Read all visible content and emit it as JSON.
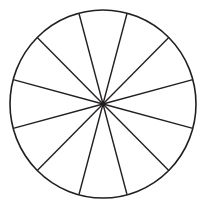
{
  "figure": {
    "name": "fraction-circle",
    "title": "Circle divided into twelve equal sectors",
    "shape": "circle",
    "background_color": "#ffffff",
    "stroke_color": "#231f20",
    "fill_color": "#ffffff",
    "outline_stroke_width": 1.6,
    "divider_stroke_width": 1.4
  },
  "geometry": {
    "center_x": 103,
    "center_y": 104,
    "radius_x": 93,
    "radius_y": 94,
    "bounds": {
      "left": 10,
      "top": 10,
      "right": 196,
      "bottom": 198
    }
  },
  "sectors": {
    "count": 12,
    "angle_step_degrees": 30,
    "angle_offset_degrees": 15,
    "fraction_each": "1/12",
    "divider_angles_degrees": [
      15,
      45,
      75,
      105,
      135,
      165,
      195,
      225,
      255,
      285,
      315,
      345
    ],
    "labels": [
      "1/12",
      "1/12",
      "1/12",
      "1/12",
      "1/12",
      "1/12",
      "1/12",
      "1/12",
      "1/12",
      "1/12",
      "1/12",
      "1/12"
    ]
  },
  "chart_data": {
    "type": "pie",
    "title": "",
    "categories": [
      "1",
      "2",
      "3",
      "4",
      "5",
      "6",
      "7",
      "8",
      "9",
      "10",
      "11",
      "12"
    ],
    "values": [
      1,
      1,
      1,
      1,
      1,
      1,
      1,
      1,
      1,
      1,
      1,
      1
    ],
    "slice_fraction": 0.0833333,
    "slice_degrees": 30,
    "start_angle_degrees": 15,
    "legend": "none",
    "grid": false,
    "colors": [
      "#ffffff"
    ],
    "stroke": "#231f20",
    "xlabel": "",
    "ylabel": ""
  }
}
